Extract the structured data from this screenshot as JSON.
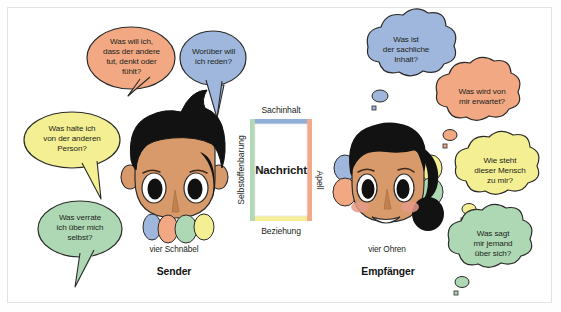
{
  "diagram": {
    "title_model": "Vier-Seiten-Modell",
    "colors": {
      "bubble_orange": "#f1a883",
      "bubble_blue": "#9fb7dc",
      "bubble_yellow": "#f5ef93",
      "bubble_green": "#aed8b4",
      "outline": "#2b2b2b",
      "skin": "#d89a6a",
      "skin_shadow": "#c0814f",
      "hair": "#121212",
      "cheek": "#e79a87",
      "frame_border": "#e2e2e2",
      "background": "#ffffff",
      "side_sachinhalt": "#8fafd8",
      "side_apell": "#f2a98a",
      "side_beziehung": "#f6ef9a",
      "side_selbstoffenbarung": "#b3d8b5"
    },
    "sender": {
      "beaks_label": "vier Schnäbel",
      "role_label": "Sender",
      "beak_colors": [
        "#9fb7dc",
        "#f1a883",
        "#aed8b4",
        "#f5ef93"
      ],
      "bubbles": [
        {
          "id": "sender-apell",
          "color": "#f1a883",
          "lines": [
            "Was will ich,",
            "dass der andere",
            "tut, denkt oder",
            "fühlt?"
          ]
        },
        {
          "id": "sender-sachinhalt",
          "color": "#9fb7dc",
          "lines": [
            "Worüber will",
            "ich reden?"
          ]
        },
        {
          "id": "sender-beziehung",
          "color": "#f5ef93",
          "lines": [
            "Was halte ich",
            "von der anderen",
            "Person?"
          ]
        },
        {
          "id": "sender-selbstoffenbarung",
          "color": "#aed8b4",
          "lines": [
            "Was verrate",
            "ich über mich",
            "selbst?"
          ]
        }
      ]
    },
    "message_square": {
      "center_label": "Nachricht",
      "top_label": "Sachinhalt",
      "right_label": "Apell",
      "bottom_label": "Beziehung",
      "left_label": "Selbstoffenbarung"
    },
    "receiver": {
      "ears_label": "vier Ohren",
      "role_label": "Empfänger",
      "ear_colors": [
        "#9fb7dc",
        "#f1a883",
        "#f5ef93",
        "#aed8b4"
      ],
      "bubbles": [
        {
          "id": "receiver-sachinhalt",
          "color": "#9fb7dc",
          "lines": [
            "Was ist",
            "der sachliche",
            "Inhalt?"
          ]
        },
        {
          "id": "receiver-apell",
          "color": "#f1a883",
          "lines": [
            "Was wird von",
            "mir erwartet?"
          ]
        },
        {
          "id": "receiver-beziehung",
          "color": "#f5ef93",
          "lines": [
            "Wie steht",
            "dieser Mensch",
            "zu mir?"
          ]
        },
        {
          "id": "receiver-selbstoffenbarung",
          "color": "#aed8b4",
          "lines": [
            "Was sagt",
            "mir jemand",
            "über sich?"
          ]
        }
      ]
    }
  }
}
